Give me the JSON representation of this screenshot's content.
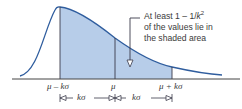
{
  "diagram": {
    "type": "chebyshev-inequality-illustration",
    "colors": {
      "curve": "#2f5d9e",
      "shade": "#b7cde9",
      "lines": "#3a3a4a",
      "text": "#3a3a3a"
    },
    "annotation": {
      "line1_prefix": "At least 1 – 1/",
      "line1_var": "k",
      "line1_exp": "2",
      "line2": "of the values lie in",
      "line3": "the shaded area"
    },
    "axis_labels": {
      "left": "μ – kσ",
      "center": "μ",
      "right": "μ + kσ"
    },
    "intervals": {
      "left": "kσ",
      "right": "kσ"
    }
  }
}
